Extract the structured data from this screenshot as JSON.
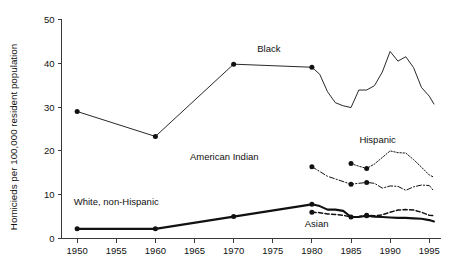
{
  "chart_data": {
    "type": "line",
    "title": "",
    "xlabel": "",
    "ylabel": "Homicieds per 100,000 resident population",
    "xlim": [
      1948,
      1996.5
    ],
    "ylim": [
      0,
      50
    ],
    "xticks": [
      1950,
      1955,
      1960,
      1965,
      1970,
      1975,
      1980,
      1985,
      1990,
      1995
    ],
    "xtick_labels": [
      "1950",
      "1955",
      "1960",
      "1965",
      "1970",
      "1975",
      "1980",
      "1985",
      "1990",
      "1995"
    ],
    "yticks": [
      0,
      10,
      20,
      30,
      40,
      50
    ],
    "ytick_labels": [
      "0",
      "10",
      "20",
      "30",
      "40",
      "50"
    ],
    "grid": false,
    "legend": "inline-annotations",
    "series": [
      {
        "name": "Black",
        "label": "Black",
        "style": "solid-thin",
        "stroke_width": 0.9,
        "dash": "none",
        "label_x": 1974.5,
        "label_y": 42.6,
        "x": [
          1950,
          1960,
          1970,
          1980,
          1981,
          1982,
          1983,
          1984,
          1985,
          1986,
          1987,
          1988,
          1989,
          1990,
          1991,
          1992,
          1993,
          1994,
          1995,
          1995.6
        ],
        "y": [
          29.0,
          23.3,
          39.8,
          39.1,
          37.5,
          33.5,
          31.0,
          30.3,
          29.9,
          33.9,
          33.9,
          34.9,
          38.0,
          42.7,
          40.5,
          41.5,
          39.0,
          34.5,
          32.5,
          30.7
        ],
        "markers_x": [
          1950,
          1960,
          1970,
          1980
        ],
        "markers_y": [
          29.0,
          23.3,
          39.8,
          39.1
        ]
      },
      {
        "name": "Hispanic",
        "label": "Hispanic",
        "style": "dotted",
        "stroke_width": 1.0,
        "dash": "1.4,1.7",
        "label_x": 1988.4,
        "label_y": 21.8,
        "x": [
          1985,
          1986,
          1987,
          1988,
          1989,
          1990,
          1991,
          1992,
          1993,
          1994,
          1995,
          1995.6
        ],
        "y": [
          17.1,
          16.5,
          16.0,
          17.0,
          18.5,
          20.0,
          19.6,
          19.5,
          18.0,
          16.3,
          14.5,
          14.0
        ],
        "markers_x": [
          1985,
          1987
        ],
        "markers_y": [
          17.1,
          16.0
        ]
      },
      {
        "name": "American Indian",
        "label": "American Indian",
        "style": "dash-dot",
        "stroke_width": 1.0,
        "dash": "5,2,1.2,2",
        "label_x": 1968.8,
        "label_y": 17.9,
        "x": [
          1980,
          1982,
          1985,
          1987,
          1988,
          1989,
          1990,
          1991,
          1992,
          1993,
          1994,
          1995,
          1995.6
        ],
        "y": [
          16.4,
          14.2,
          12.4,
          12.8,
          12.6,
          11.5,
          12.0,
          11.9,
          11.0,
          11.8,
          12.2,
          12.1,
          10.8
        ],
        "markers_x": [
          1980,
          1985,
          1987
        ],
        "markers_y": [
          16.4,
          12.4,
          12.8
        ]
      },
      {
        "name": "White, non-Hispanic",
        "label": "White, non-Hispanic",
        "style": "solid-thick",
        "stroke_width": 2.1,
        "dash": "none",
        "label_x": 1955.0,
        "label_y": 7.6,
        "x": [
          1950,
          1960,
          1970,
          1980,
          1981,
          1982,
          1983,
          1984,
          1985,
          1986,
          1987,
          1988,
          1989,
          1990,
          1991,
          1992,
          1993,
          1994,
          1995,
          1995.6
        ],
        "y": [
          2.2,
          2.2,
          5.0,
          7.8,
          7.4,
          6.6,
          6.6,
          6.3,
          4.9,
          4.9,
          5.2,
          5.0,
          4.9,
          4.8,
          4.7,
          4.7,
          4.6,
          4.5,
          4.2,
          3.9
        ],
        "markers_x": [
          1950,
          1960,
          1970,
          1980,
          1987
        ],
        "markers_y": [
          2.2,
          2.2,
          5.0,
          7.8,
          5.2
        ]
      },
      {
        "name": "Asian",
        "label": "Asian",
        "style": "dashed",
        "stroke_width": 1.5,
        "dash": "4.2,2.4",
        "label_x": 1980.6,
        "label_y": 2.6,
        "x": [
          1980,
          1981,
          1982,
          1983,
          1984,
          1985,
          1986,
          1987,
          1988,
          1989,
          1990,
          1991,
          1992,
          1993,
          1994,
          1995,
          1995.6
        ],
        "y": [
          6.0,
          5.9,
          5.6,
          5.5,
          5.3,
          4.9,
          5.0,
          5.3,
          5.2,
          5.4,
          6.0,
          6.5,
          6.6,
          6.5,
          6.0,
          5.3,
          5.2
        ],
        "markers_x": [
          1980,
          1985,
          1987
        ],
        "markers_y": [
          6.0,
          4.9,
          5.3
        ]
      }
    ]
  }
}
